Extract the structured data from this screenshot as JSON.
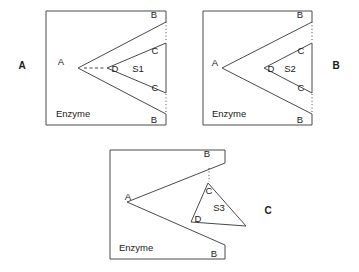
{
  "figure": {
    "stroke_color": "#4a4a4a",
    "text_color": "#1a1a1a",
    "background_color": "#ffffff"
  },
  "panels": [
    {
      "id": "panel-a",
      "panel_label": "A",
      "enzyme_label": "Enzyme",
      "substrate_label": "S1",
      "vertex_labels": {
        "active_site_apex": "A",
        "top_outer": "B",
        "bottom_outer": "B",
        "top_inner": "C",
        "bottom_inner": "C",
        "substrate_apex": "D"
      }
    },
    {
      "id": "panel-b",
      "panel_label": "B",
      "enzyme_label": "Enzyme",
      "substrate_label": "S2",
      "vertex_labels": {
        "active_site_apex": "A",
        "top_outer": "B",
        "bottom_outer": "B",
        "top_inner": "C",
        "bottom_inner": "C",
        "substrate_apex": "D"
      }
    },
    {
      "id": "panel-c",
      "panel_label": "C",
      "enzyme_label": "Enzyme",
      "substrate_label": "S3",
      "vertex_labels": {
        "active_site_apex": "A",
        "top_outer": "B",
        "bottom_outer": "B",
        "top_inner": "C",
        "substrate_apex": "D"
      }
    }
  ]
}
